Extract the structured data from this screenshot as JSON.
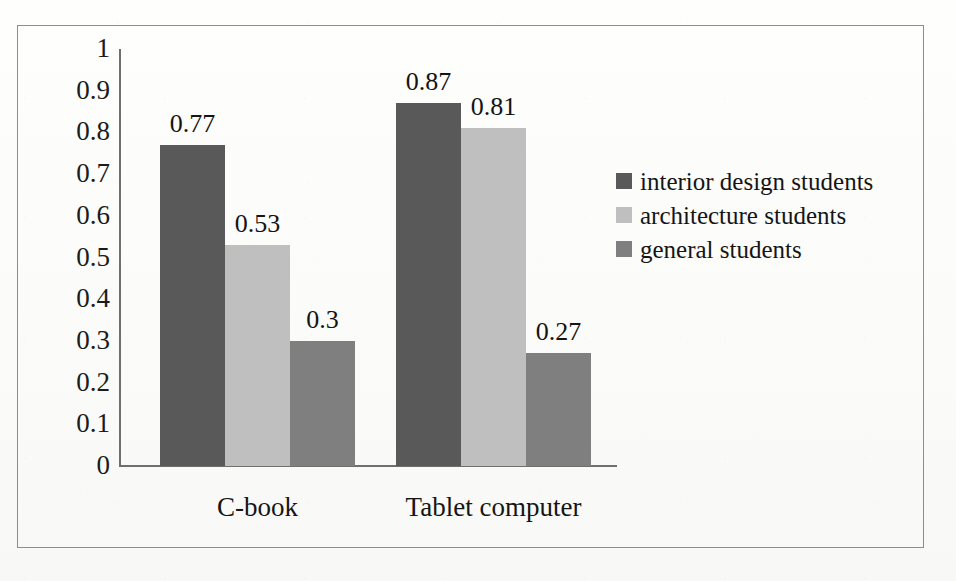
{
  "chart_data": {
    "type": "bar",
    "title": "",
    "subtitle": "",
    "xlabel": "",
    "ylabel": "",
    "categories": [
      "C-book",
      "Tablet computer"
    ],
    "series": [
      {
        "name": "interior design students",
        "color": "#595959",
        "values": [
          0.77,
          0.87
        ],
        "labels": [
          "0.77",
          "0.87"
        ]
      },
      {
        "name": "architecture students",
        "color": "#bfbfbf",
        "values": [
          0.53,
          0.81
        ],
        "labels": [
          "0.53",
          "0.81"
        ]
      },
      {
        "name": "general students",
        "color": "#7f7f7f",
        "values": [
          0.3,
          0.27
        ],
        "labels": [
          "0.3",
          "0.27"
        ]
      }
    ],
    "ylim": [
      0,
      1
    ],
    "ytick_labels": [
      "1",
      "0.9",
      "0.8",
      "0.7",
      "0.6",
      "0.5",
      "0.4",
      "0.3",
      "0.2",
      "0.1",
      "0"
    ],
    "ytick_values": [
      1,
      0.9,
      0.8,
      0.7,
      0.6,
      0.5,
      0.4,
      0.3,
      0.2,
      0.1,
      0
    ],
    "grid": false,
    "legend_position": "right",
    "data_labels_shown": true,
    "axis_color": "#6f6f6f",
    "frame_color": "#8d8d8d",
    "background_color": "#fdfdfc"
  },
  "legend": {
    "items": [
      {
        "label": "interior design students",
        "color": "#595959"
      },
      {
        "label": "architecture students",
        "color": "#bfbfbf"
      },
      {
        "label": "general students",
        "color": "#7f7f7f"
      }
    ]
  },
  "axis": {
    "y_ticks": [
      "1",
      "0.9",
      "0.8",
      "0.7",
      "0.6",
      "0.5",
      "0.4",
      "0.3",
      "0.2",
      "0.1",
      "0"
    ],
    "x_categories": [
      "C-book",
      "Tablet computer"
    ]
  },
  "values": {
    "c_book": {
      "interior_design": "0.77",
      "architecture": "0.53",
      "general": "0.3"
    },
    "tablet_computer": {
      "interior_design": "0.87",
      "architecture": "0.81",
      "general": "0.27"
    }
  }
}
